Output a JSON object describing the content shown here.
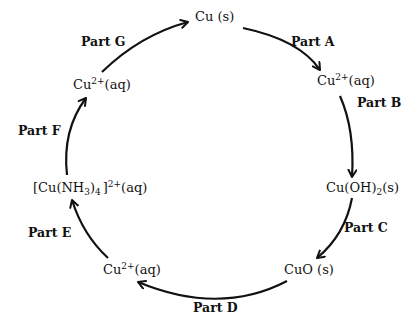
{
  "diagram": {
    "type": "reaction-cycle",
    "stroke_color": "#111111",
    "species": {
      "cu_solid": {
        "base": "Cu (s)"
      },
      "cu2_aq_a": {
        "base": "Cu",
        "sup": "2+",
        "tail": "(aq)"
      },
      "cu_oh2": {
        "base": "Cu(OH)",
        "sub": "2",
        "tail": "(s)"
      },
      "cuo": {
        "base": "CuO (s)"
      },
      "cu2_aq_d": {
        "base": "Cu",
        "sup": "2+",
        "tail": "(aq)"
      },
      "complex": {
        "open": "[Cu(NH",
        "sub1": "3",
        "mid": ")",
        "sub2": "4",
        "close": "]",
        "sup": "2+",
        "tail": "(aq)"
      },
      "cu2_aq_f": {
        "base": "Cu",
        "sup": "2+",
        "tail": "(aq)"
      }
    },
    "parts": {
      "a": "Part A",
      "b": "Part B",
      "c": "Part C",
      "d": "Part D",
      "e": "Part E",
      "f": "Part F",
      "g": "Part G"
    },
    "steps": [
      {
        "part": "Part A",
        "from": "Cu (s)",
        "to": "Cu2+(aq)"
      },
      {
        "part": "Part B",
        "from": "Cu2+(aq)",
        "to": "Cu(OH)2(s)"
      },
      {
        "part": "Part C",
        "from": "Cu(OH)2(s)",
        "to": "CuO (s)"
      },
      {
        "part": "Part D",
        "from": "CuO (s)",
        "to": "Cu2+(aq)"
      },
      {
        "part": "Part E",
        "from": "Cu2+(aq)",
        "to": "[Cu(NH3)4]2+(aq)"
      },
      {
        "part": "Part F",
        "from": "[Cu(NH3)4]2+(aq)",
        "to": "Cu2+(aq)"
      },
      {
        "part": "Part G",
        "from": "Cu2+(aq)",
        "to": "Cu (s)"
      }
    ]
  }
}
